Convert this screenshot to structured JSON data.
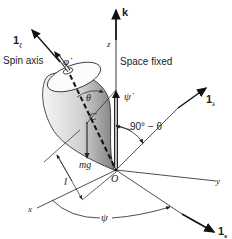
{
  "diagram": {
    "labels": {
      "spin_axis_unit": "1",
      "spin_axis_unit_sub": "ζ",
      "spin_axis": "Spin axis",
      "phi_dot": "φ̇",
      "space_fixed": "Space fixed",
      "k": "k",
      "z": "z",
      "psi_dot": "ψ̇",
      "lambda_unit": "1",
      "lambda_unit_sub": "λ",
      "theta": "θ",
      "complement_angle": "90° − θ",
      "center_of_mass": "C",
      "weight": "mg",
      "lever_arm": "l",
      "origin": "O",
      "x": "x",
      "y": "y",
      "psi": "ψ",
      "kappa_unit": "1",
      "kappa_unit_sub": "κ"
    },
    "colors": {
      "line": "#222222",
      "body_light": "#f4f4f4",
      "body_dark": "#8a8a8a"
    }
  }
}
